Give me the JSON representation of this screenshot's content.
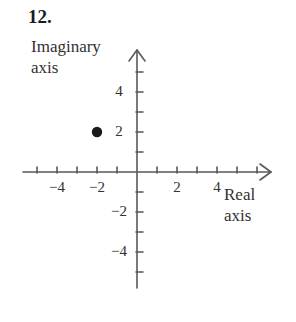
{
  "problem": {
    "number": "12."
  },
  "labels": {
    "imaginary_axis_line1": "Imaginary",
    "imaginary_axis_line2": "axis",
    "real_axis_line1": "Real",
    "real_axis_line2": "axis"
  },
  "colors": {
    "axis": "#5a585a",
    "text": "#333032",
    "point": "#1a1a1a",
    "background": "#ffffff"
  },
  "chart_data": {
    "type": "scatter",
    "title": "",
    "xlabel": "Real axis",
    "ylabel": "Imaginary axis",
    "xlim": [
      -6,
      7
    ],
    "ylim": [
      -6,
      6
    ],
    "grid": false,
    "legend": null,
    "xtick_values": [
      -5,
      -4,
      -3,
      -2,
      -1,
      1,
      2,
      3,
      4,
      5,
      6
    ],
    "ytick_values": [
      5,
      4,
      3,
      2,
      1,
      -1,
      -2,
      -3,
      -4,
      -5
    ],
    "xtick_labels": [
      {
        "value": -4,
        "text": "−4"
      },
      {
        "value": -2,
        "text": "−2"
      },
      {
        "value": 2,
        "text": "2"
      },
      {
        "value": 4,
        "text": "4"
      }
    ],
    "ytick_labels": [
      {
        "value": 4,
        "text": "4"
      },
      {
        "value": 2,
        "text": "2"
      },
      {
        "value": -2,
        "text": "−2"
      },
      {
        "value": -4,
        "text": "−4"
      }
    ],
    "points": [
      {
        "x": -2,
        "y": 2,
        "label": "",
        "marker": "filled-circle"
      }
    ]
  }
}
